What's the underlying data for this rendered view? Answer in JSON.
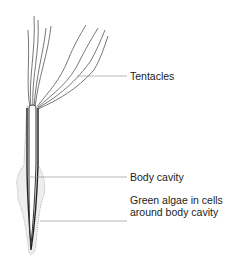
{
  "diagram": {
    "labels": {
      "tentacles": "Tentacles",
      "body_cavity": "Body cavity",
      "green_algae": "Green algae in cells around body cavity"
    },
    "colors": {
      "line": "#333333",
      "leader": "#888888",
      "stipple": "#bbbbbb"
    }
  }
}
